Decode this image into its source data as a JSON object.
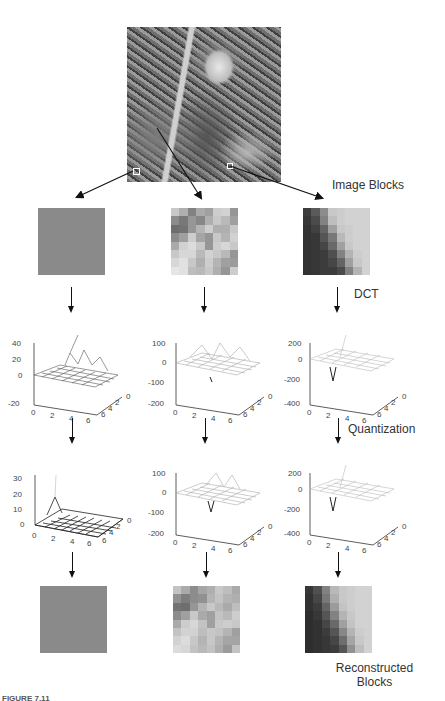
{
  "figure": {
    "caption_partial": "FIGURE 7.11",
    "source_image_description": "grayscale photo of a doll/elf figurine with three marked 8x8 blocks"
  },
  "labels": {
    "image_blocks": "Image Blocks",
    "dct": "DCT",
    "quantization": "Quantization",
    "reconstructed_line1": "Reconstructed",
    "reconstructed_line2": "Blocks"
  },
  "columns": [
    {
      "name": "flat-block",
      "image_block_shade": "#8a8a8a",
      "dct_plot": {
        "z_ticks": [
          "40",
          "20",
          "0",
          "-20"
        ],
        "x_ticks": [
          "0",
          "2",
          "4",
          "6"
        ],
        "y_ticks": [
          "6",
          "4",
          "2",
          "0"
        ]
      },
      "quant_plot": {
        "z_ticks": [
          "30",
          "20",
          "10",
          "0"
        ],
        "x_ticks": [
          "0",
          "2",
          "4",
          "6"
        ],
        "y_ticks": [
          "6",
          "4",
          "2",
          "0"
        ]
      },
      "reconstructed_shade": "#8a8a8a"
    },
    {
      "name": "textured-block",
      "dct_plot": {
        "z_ticks": [
          "100",
          "0",
          "-100",
          "-200"
        ],
        "x_ticks": [
          "0",
          "2",
          "4",
          "6"
        ],
        "y_ticks": [
          "6",
          "4",
          "2",
          "0"
        ]
      },
      "quant_plot": {
        "z_ticks": [
          "100",
          "0",
          "-100",
          "-200"
        ],
        "x_ticks": [
          "0",
          "2",
          "4",
          "6"
        ],
        "y_ticks": [
          "6",
          "4",
          "2",
          "0"
        ]
      }
    },
    {
      "name": "edge-block",
      "dct_plot": {
        "z_ticks": [
          "200",
          "0",
          "-200",
          "-400"
        ],
        "x_ticks": [
          "0",
          "2",
          "4",
          "6"
        ],
        "y_ticks": [
          "6",
          "4",
          "2",
          "0"
        ]
      },
      "quant_plot": {
        "z_ticks": [
          "200",
          "0",
          "-200",
          "-400"
        ],
        "x_ticks": [
          "0",
          "2",
          "4",
          "6"
        ],
        "y_ticks": [
          "6",
          "4",
          "2",
          "0"
        ]
      }
    }
  ],
  "blocks": {
    "textured_original": [
      [
        200,
        175,
        130,
        170,
        160,
        205,
        210,
        150
      ],
      [
        140,
        120,
        150,
        135,
        175,
        200,
        185,
        160
      ],
      [
        110,
        115,
        150,
        180,
        205,
        175,
        175,
        200
      ],
      [
        140,
        160,
        205,
        165,
        150,
        200,
        180,
        210
      ],
      [
        170,
        210,
        220,
        200,
        150,
        205,
        215,
        200
      ],
      [
        200,
        215,
        215,
        185,
        210,
        200,
        185,
        150
      ],
      [
        215,
        225,
        200,
        175,
        205,
        180,
        160,
        155
      ],
      [
        230,
        225,
        190,
        185,
        200,
        175,
        150,
        205
      ]
    ],
    "edge_original": [
      [
        60,
        90,
        140,
        200,
        205,
        210,
        210,
        210
      ],
      [
        55,
        75,
        130,
        190,
        205,
        210,
        210,
        210
      ],
      [
        50,
        65,
        100,
        160,
        200,
        205,
        210,
        210
      ],
      [
        50,
        55,
        85,
        120,
        185,
        205,
        210,
        210
      ],
      [
        50,
        55,
        70,
        105,
        160,
        200,
        210,
        210
      ],
      [
        50,
        55,
        60,
        80,
        130,
        180,
        205,
        210
      ],
      [
        50,
        55,
        60,
        70,
        100,
        160,
        200,
        210
      ],
      [
        50,
        55,
        60,
        60,
        75,
        130,
        180,
        210
      ]
    ],
    "textured_reconstructed": [
      [
        195,
        170,
        140,
        165,
        175,
        200,
        190,
        170
      ],
      [
        145,
        125,
        140,
        145,
        180,
        195,
        180,
        175
      ],
      [
        115,
        110,
        150,
        180,
        200,
        185,
        170,
        190
      ],
      [
        140,
        160,
        200,
        170,
        160,
        195,
        185,
        205
      ],
      [
        170,
        205,
        215,
        195,
        160,
        200,
        205,
        200
      ],
      [
        195,
        210,
        210,
        190,
        200,
        195,
        180,
        160
      ],
      [
        210,
        220,
        200,
        180,
        200,
        180,
        165,
        165
      ],
      [
        220,
        215,
        195,
        185,
        195,
        175,
        155,
        195
      ]
    ],
    "edge_reconstructed": [
      [
        55,
        80,
        130,
        185,
        200,
        205,
        210,
        210
      ],
      [
        50,
        70,
        120,
        175,
        200,
        205,
        210,
        210
      ],
      [
        50,
        60,
        100,
        155,
        195,
        205,
        210,
        210
      ],
      [
        45,
        55,
        85,
        130,
        180,
        200,
        210,
        210
      ],
      [
        45,
        50,
        70,
        105,
        160,
        195,
        210,
        210
      ],
      [
        45,
        50,
        60,
        85,
        135,
        180,
        205,
        210
      ],
      [
        45,
        50,
        55,
        70,
        110,
        165,
        200,
        210
      ],
      [
        45,
        50,
        55,
        60,
        85,
        145,
        190,
        210
      ]
    ]
  }
}
